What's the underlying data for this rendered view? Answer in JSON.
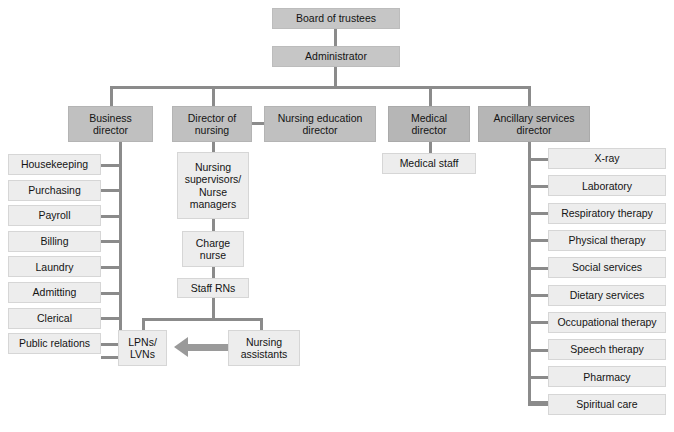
{
  "chart": {
    "type": "org-chart",
    "colors": {
      "executive_box": "#c6c6c6",
      "director_box": "#c0c0c0",
      "leaf_box": "#ededed",
      "connector": "#8b8b8b",
      "arrow": "#9a9a9a",
      "text": "#141414",
      "background": "#ffffff"
    }
  },
  "nodes": {
    "board": "Board of trustees",
    "administrator": "Administrator",
    "business_director": "Business\ndirector",
    "director_of_nursing": "Director of\nnursing",
    "nursing_education_director": "Nursing education\ndirector",
    "medical_director": "Medical\ndirector",
    "ancillary_services_director": "Ancillary services\ndirector",
    "medical_staff": "Medical staff",
    "nursing_supervisors": "Nursing\nsupervisors/\nNurse\nmanagers",
    "charge_nurse": "Charge\nnurse",
    "staff_rns": "Staff RNs",
    "lpns_lvns": "LPNs/\nLVNs",
    "nursing_assistants": "Nursing\nassistants"
  },
  "business_units": [
    {
      "label": "Housekeeping"
    },
    {
      "label": "Purchasing"
    },
    {
      "label": "Payroll"
    },
    {
      "label": "Billing"
    },
    {
      "label": "Laundry"
    },
    {
      "label": "Admitting"
    },
    {
      "label": "Clerical"
    },
    {
      "label": "Public relations"
    }
  ],
  "ancillary_units": [
    {
      "label": "X-ray"
    },
    {
      "label": "Laboratory"
    },
    {
      "label": "Respiratory therapy"
    },
    {
      "label": "Physical therapy"
    },
    {
      "label": "Social services"
    },
    {
      "label": "Dietary services"
    },
    {
      "label": "Occupational therapy"
    },
    {
      "label": "Speech therapy"
    },
    {
      "label": "Pharmacy"
    },
    {
      "label": "Spiritual care"
    }
  ]
}
